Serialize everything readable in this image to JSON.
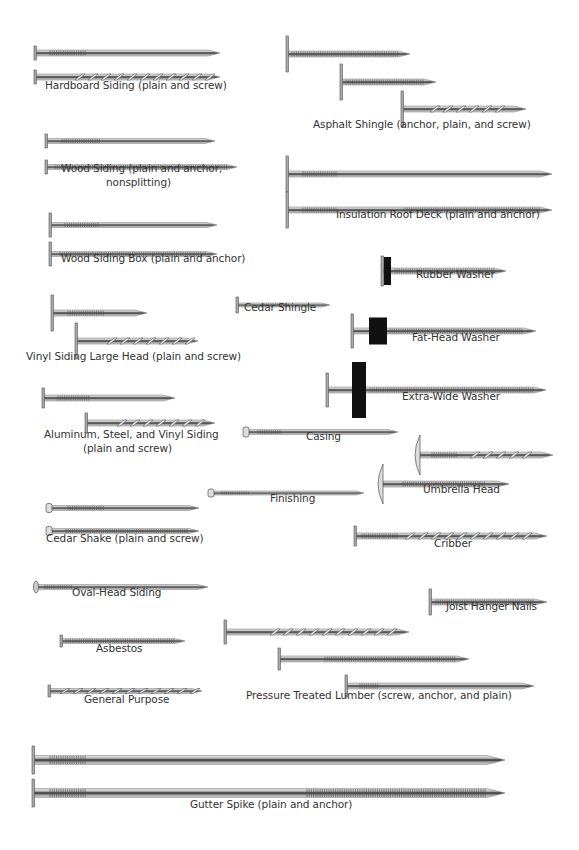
{
  "colors": {
    "shank_light": "#d9d9d9",
    "shank_mid": "#9a9a9a",
    "shank_dark": "#2a2a2a",
    "washer": "#111111",
    "label": "#333333"
  },
  "nails": [
    {
      "id": "hardboard-plain",
      "x1": 36,
      "x2": 220,
      "y": 53,
      "h": 6,
      "head": "flat",
      "headH": 14,
      "rings": [
        [
          50,
          86
        ]
      ],
      "screw": []
    },
    {
      "id": "hardboard-screw",
      "x1": 36,
      "x2": 220,
      "y": 77,
      "h": 6,
      "head": "flat",
      "headH": 14,
      "rings": [],
      "screw": [
        [
          75,
          210
        ]
      ]
    },
    {
      "id": "asphalt-anchor",
      "x1": 288,
      "x2": 410,
      "y": 54,
      "h": 6,
      "head": "flat",
      "headH": 36,
      "rings": [
        [
          292,
          400
        ]
      ],
      "screw": []
    },
    {
      "id": "asphalt-plain",
      "x1": 342,
      "x2": 436,
      "y": 82,
      "h": 6,
      "head": "flat",
      "headH": 36,
      "rings": [
        [
          346,
          424
        ]
      ],
      "screw": []
    },
    {
      "id": "asphalt-screw",
      "x1": 403,
      "x2": 526,
      "y": 109,
      "h": 6,
      "head": "flat",
      "headH": 36,
      "rings": [],
      "screw": [
        [
          430,
          505
        ]
      ]
    },
    {
      "id": "wood-siding-plain",
      "x1": 47,
      "x2": 215,
      "y": 141,
      "h": 5,
      "head": "flat",
      "headH": 14,
      "rings": [
        [
          62,
          100
        ]
      ],
      "screw": []
    },
    {
      "id": "wood-siding-anchor",
      "x1": 47,
      "x2": 237,
      "y": 167,
      "h": 5,
      "head": "flat",
      "headH": 14,
      "rings": [
        [
          55,
          228
        ]
      ],
      "screw": []
    },
    {
      "id": "insulation-plain",
      "x1": 288,
      "x2": 552,
      "y": 174,
      "h": 6,
      "head": "flat",
      "headH": 36,
      "rings": [
        [
          303,
          338
        ]
      ],
      "screw": []
    },
    {
      "id": "insulation-anchor",
      "x1": 288,
      "x2": 552,
      "y": 210,
      "h": 6,
      "head": "flat",
      "headH": 36,
      "rings": [
        [
          303,
          338
        ],
        [
          405,
          540
        ]
      ],
      "screw": []
    },
    {
      "id": "wood-siding-box-plain",
      "x1": 51,
      "x2": 217,
      "y": 225,
      "h": 5,
      "head": "flat",
      "headH": 24,
      "rings": [
        [
          65,
          100
        ]
      ],
      "screw": []
    },
    {
      "id": "wood-siding-box-anchor",
      "x1": 51,
      "x2": 217,
      "y": 254,
      "h": 5,
      "head": "flat",
      "headH": 24,
      "rings": [
        [
          60,
          210
        ]
      ],
      "screw": []
    },
    {
      "id": "rubber-washer",
      "x1": 383,
      "x2": 506,
      "y": 271,
      "h": 6,
      "head": "washer",
      "headH": 30,
      "washerW": 7,
      "washerH": 28,
      "washerX": 384,
      "rings": [
        [
          395,
          495
        ]
      ],
      "screw": []
    },
    {
      "id": "vinyl-large-plain",
      "x1": 53,
      "x2": 147,
      "y": 313,
      "h": 6,
      "head": "flat",
      "headH": 36,
      "rings": [
        [
          68,
          104
        ]
      ],
      "screw": []
    },
    {
      "id": "vinyl-large-screw",
      "x1": 77,
      "x2": 198,
      "y": 341,
      "h": 6,
      "head": "flat",
      "headH": 36,
      "rings": [],
      "screw": [
        [
          107,
          190
        ]
      ]
    },
    {
      "id": "cedar-shingle",
      "x1": 238,
      "x2": 330,
      "y": 305,
      "h": 4,
      "head": "flat",
      "headH": 16,
      "rings": [
        [
          262,
          290
        ]
      ],
      "screw": []
    },
    {
      "id": "fat-head-washer",
      "x1": 353,
      "x2": 536,
      "y": 331,
      "h": 6,
      "head": "washer",
      "headH": 34,
      "washerW": 18,
      "washerH": 27,
      "washerX": 369,
      "rings": [
        [
          390,
          525
        ]
      ],
      "screw": []
    },
    {
      "id": "extra-wide-washer",
      "x1": 328,
      "x2": 546,
      "y": 390,
      "h": 6,
      "head": "washer",
      "headH": 34,
      "washerW": 14,
      "washerH": 56,
      "washerX": 352,
      "rings": [
        [
          370,
          535
        ]
      ],
      "screw": []
    },
    {
      "id": "aluminum-plain",
      "x1": 44,
      "x2": 175,
      "y": 398,
      "h": 6,
      "head": "flat",
      "headH": 20,
      "rings": [
        [
          58,
          90
        ]
      ],
      "screw": []
    },
    {
      "id": "aluminum-screw",
      "x1": 87,
      "x2": 215,
      "y": 423,
      "h": 6,
      "head": "flat",
      "headH": 20,
      "rings": [],
      "screw": [
        [
          117,
          195
        ]
      ]
    },
    {
      "id": "casing",
      "x1": 246,
      "x2": 398,
      "y": 432,
      "h": 5,
      "head": "cup",
      "headH": 10,
      "rings": [
        [
          258,
          282
        ]
      ],
      "screw": []
    },
    {
      "id": "umbrella-screw",
      "x1": 420,
      "x2": 553,
      "y": 455,
      "h": 6,
      "head": "umbrella",
      "headH": 40,
      "rings": [
        [
          432,
          458
        ]
      ],
      "screw": [
        [
          470,
          530
        ]
      ]
    },
    {
      "id": "umbrella-anchor",
      "x1": 383,
      "x2": 509,
      "y": 484,
      "h": 6,
      "head": "umbrella",
      "headH": 40,
      "rings": [
        [
          403,
          485
        ]
      ],
      "screw": []
    },
    {
      "id": "finishing",
      "x1": 211,
      "x2": 364,
      "y": 493,
      "h": 4,
      "head": "cup",
      "headH": 8,
      "rings": [
        [
          222,
          250
        ]
      ],
      "screw": []
    },
    {
      "id": "cedar-shake-plain",
      "x1": 49,
      "x2": 199,
      "y": 508,
      "h": 5,
      "head": "cup",
      "headH": 9,
      "rings": [
        [
          68,
          105
        ]
      ],
      "screw": []
    },
    {
      "id": "cedar-shake-anchor",
      "x1": 49,
      "x2": 199,
      "y": 531,
      "h": 5,
      "head": "cup",
      "headH": 9,
      "rings": [
        [
          66,
          192
        ]
      ],
      "screw": []
    },
    {
      "id": "cribber",
      "x1": 356,
      "x2": 547,
      "y": 536,
      "h": 6,
      "head": "flat",
      "headH": 20,
      "rings": [
        [
          362,
          398
        ]
      ],
      "screw": [
        [
          405,
          530
        ]
      ]
    },
    {
      "id": "oval-head-siding",
      "x1": 36,
      "x2": 208,
      "y": 587,
      "h": 5,
      "head": "oval",
      "headH": 12,
      "rings": [
        [
          45,
          72
        ]
      ],
      "screw": []
    },
    {
      "id": "joist-hanger",
      "x1": 431,
      "x2": 547,
      "y": 602,
      "h": 6,
      "head": "flat",
      "headH": 26,
      "rings": [
        [
          436,
          540
        ]
      ],
      "screw": []
    },
    {
      "id": "pressure-screw",
      "x1": 226,
      "x2": 409,
      "y": 632,
      "h": 6,
      "head": "flat",
      "headH": 24,
      "rings": [],
      "screw": [
        [
          270,
          400
        ]
      ]
    },
    {
      "id": "asbestos",
      "x1": 62,
      "x2": 185,
      "y": 641,
      "h": 5,
      "head": "flat",
      "headH": 12,
      "rings": [
        [
          66,
          180
        ]
      ],
      "screw": []
    },
    {
      "id": "pressure-anchor",
      "x1": 280,
      "x2": 469,
      "y": 659,
      "h": 6,
      "head": "flat",
      "headH": 22,
      "rings": [
        [
          325,
          455
        ]
      ],
      "screw": []
    },
    {
      "id": "pressure-plain",
      "x1": 347,
      "x2": 534,
      "y": 686,
      "h": 6,
      "head": "flat",
      "headH": 22,
      "rings": [
        [
          360,
          378
        ]
      ],
      "screw": []
    },
    {
      "id": "general-purpose",
      "x1": 50,
      "x2": 202,
      "y": 691,
      "h": 5,
      "head": "flat",
      "headH": 12,
      "rings": [],
      "screw": [
        [
          60,
          195
        ]
      ]
    },
    {
      "id": "gutter-spike-plain",
      "x1": 34,
      "x2": 505,
      "y": 760,
      "h": 9,
      "head": "flat",
      "headH": 28,
      "rings": [
        [
          50,
          86
        ]
      ],
      "screw": []
    },
    {
      "id": "gutter-spike-anchor",
      "x1": 34,
      "x2": 505,
      "y": 793,
      "h": 9,
      "head": "flat",
      "headH": 28,
      "rings": [
        [
          50,
          86
        ],
        [
          307,
          495
        ]
      ],
      "screw": []
    }
  ],
  "labels": [
    {
      "id": "hardboard-siding",
      "text": "Hardboard Siding (plain and screw)",
      "x": 45,
      "y": 89
    },
    {
      "id": "asphalt-shingle",
      "text": "Asphalt Shingle (anchor, plain, and screw)",
      "x": 313,
      "y": 128
    },
    {
      "id": "wood-siding",
      "text": "Wood Siding (plain and anchor,",
      "x": 61,
      "y": 172
    },
    {
      "id": "wood-siding-2",
      "text": "nonsplitting)",
      "x": 106,
      "y": 186
    },
    {
      "id": "insulation-roof-deck",
      "text": "Insulation Roof Deck (plain and anchor)",
      "x": 336,
      "y": 218
    },
    {
      "id": "wood-siding-box",
      "text": "Wood Siding Box (plain and anchor)",
      "x": 61,
      "y": 262
    },
    {
      "id": "rubber-washer",
      "text": "Rubber Washer",
      "x": 416,
      "y": 278
    },
    {
      "id": "cedar-shingle",
      "text": "Cedar Shingle",
      "x": 244,
      "y": 311
    },
    {
      "id": "fat-head-washer",
      "text": "Fat-Head Washer",
      "x": 412,
      "y": 341
    },
    {
      "id": "vinyl-siding-large-head",
      "text": "Vinyl Siding Large Head (plain and screw)",
      "x": 26,
      "y": 360
    },
    {
      "id": "extra-wide-washer",
      "text": "Extra-Wide Washer",
      "x": 402,
      "y": 400
    },
    {
      "id": "aluminum-steel-vinyl",
      "text": "Aluminum, Steel, and Vinyl Siding",
      "x": 44,
      "y": 438
    },
    {
      "id": "aluminum-steel-vinyl-2",
      "text": "(plain and screw)",
      "x": 83,
      "y": 452
    },
    {
      "id": "casing",
      "text": "Casing",
      "x": 306,
      "y": 440
    },
    {
      "id": "umbrella-head",
      "text": "Umbrella Head",
      "x": 423,
      "y": 493
    },
    {
      "id": "finishing",
      "text": "Finishing",
      "x": 270,
      "y": 502
    },
    {
      "id": "cedar-shake",
      "text": "Cedar Shake (plain and screw)",
      "x": 46,
      "y": 542
    },
    {
      "id": "cribber",
      "text": "Cribber",
      "x": 434,
      "y": 547
    },
    {
      "id": "oval-head-siding",
      "text": "Oval-Head Siding",
      "x": 72,
      "y": 596
    },
    {
      "id": "joist-hanger-nails",
      "text": "Joist Hanger Nails",
      "x": 446,
      "y": 610
    },
    {
      "id": "asbestos",
      "text": "Asbestos",
      "x": 96,
      "y": 652
    },
    {
      "id": "pressure-treated-lumber",
      "text": "Pressure Treated Lumber (screw, anchor, and plain)",
      "x": 246,
      "y": 699
    },
    {
      "id": "general-purpose",
      "text": "General Purpose",
      "x": 84,
      "y": 703
    },
    {
      "id": "gutter-spike",
      "text": "Gutter Spike (plain and anchor)",
      "x": 190,
      "y": 808
    }
  ]
}
